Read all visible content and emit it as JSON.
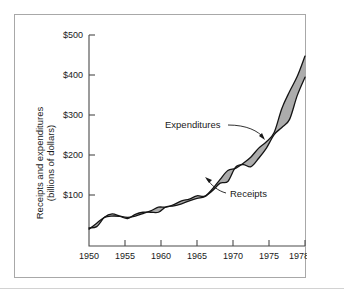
{
  "figure": {
    "background_color": "#ffffff",
    "frame_color": "#a8a8a8",
    "band_color": "#9d9d9d",
    "line_color": "#141414"
  },
  "chart_data": {
    "type": "area",
    "title": "",
    "subtitle": "",
    "xlabel": "",
    "ylabel": "Receipts and expenditures (billions of dollars)",
    "ylabel_line1": "Receipts and expenditures",
    "ylabel_line2": "(billions of dollars)",
    "xlim": [
      1950,
      1978
    ],
    "ylim": [
      0,
      500
    ],
    "grid": false,
    "legend_position": "annotated-inline",
    "y_tick_labels": [
      "$500",
      "$400",
      "$300",
      "$200",
      "$100"
    ],
    "y_ticks": [
      500,
      400,
      300,
      200,
      100
    ],
    "x_tick_labels": [
      "1950",
      "1955",
      "1960",
      "1965",
      "1970",
      "1975",
      "1978"
    ],
    "x_ticks": [
      1950,
      1955,
      1960,
      1965,
      1970,
      1975,
      1978
    ],
    "x": [
      1950,
      1951,
      1952,
      1953,
      1954,
      1955,
      1956,
      1957,
      1958,
      1959,
      1960,
      1961,
      1962,
      1963,
      1964,
      1965,
      1966,
      1967,
      1968,
      1969,
      1970,
      1971,
      1972,
      1973,
      1974,
      1975,
      1976,
      1977,
      1978
    ],
    "series": [
      {
        "name": "Expenditures",
        "label": "Expenditures",
        "values": [
          43,
          46,
          68,
          76,
          71,
          68,
          71,
          77,
          83,
          92,
          92,
          98,
          107,
          111,
          119,
          118,
          135,
          158,
          179,
          184,
          196,
          211,
          232,
          247,
          269,
          326,
          366,
          402,
          450
        ]
      },
      {
        "name": "Receipts",
        "label": "Receipts",
        "values": [
          40,
          54,
          68,
          71,
          70,
          65,
          75,
          80,
          80,
          80,
          93,
          95,
          100,
          107,
          113,
          117,
          131,
          149,
          153,
          187,
          193,
          188,
          208,
          232,
          264,
          281,
          300,
          357,
          400
        ]
      }
    ],
    "annotations": [
      {
        "text": "Expenditures",
        "points_to_year": 1974,
        "points_to_value": 300
      },
      {
        "text": "Receipts",
        "points_to_year": 1967,
        "points_to_value": 150
      }
    ]
  }
}
